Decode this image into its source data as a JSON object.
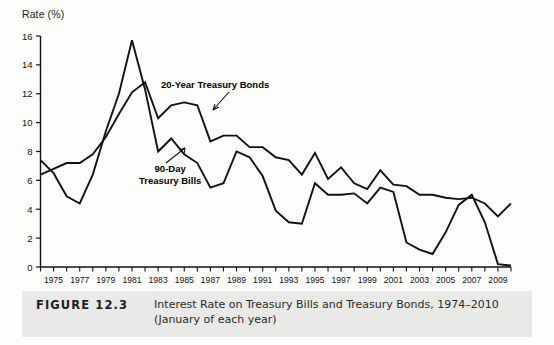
{
  "figure": {
    "number_label": "FIGURE 12.3",
    "caption_line1": "Interest Rate on Treasury Bills and Treasury Bonds, 1974–2010",
    "caption_line2": "(January of each year)"
  },
  "chart_data": {
    "type": "line",
    "title": "",
    "xlabel": "",
    "ylabel": "Rate (%)",
    "ylim": [
      0,
      16
    ],
    "xlim": [
      1974,
      2010
    ],
    "yticks": [
      0,
      2,
      4,
      6,
      8,
      10,
      12,
      14,
      16
    ],
    "ytick_labels": [
      "0",
      "2",
      "4",
      "6",
      "8",
      "10",
      "12",
      "14",
      "16"
    ],
    "xticks": [
      1974,
      1975,
      1976,
      1977,
      1978,
      1979,
      1980,
      1981,
      1982,
      1983,
      1984,
      1985,
      1986,
      1987,
      1988,
      1989,
      1990,
      1991,
      1992,
      1993,
      1994,
      1995,
      1996,
      1997,
      1998,
      1999,
      2000,
      2001,
      2002,
      2003,
      2004,
      2005,
      2006,
      2007,
      2008,
      2009,
      2010
    ],
    "xtick_labels": [
      "1975",
      "1977",
      "1979",
      "1981",
      "1983",
      "1985",
      "1987",
      "1989",
      "1991",
      "1993",
      "1995",
      "1997",
      "1999",
      "2001",
      "2003",
      "2005",
      "2007",
      "2009"
    ],
    "xtick_label_years": [
      1975,
      1977,
      1979,
      1981,
      1983,
      1985,
      1987,
      1989,
      1991,
      1993,
      1995,
      1997,
      1999,
      2001,
      2003,
      2005,
      2007,
      2009
    ],
    "grid": false,
    "legend_position": "inline-annotations",
    "line_color": "#111111",
    "series": [
      {
        "name": "20-Year Treasury Bonds",
        "annotation": "20-Year Treasury Bonds",
        "x": [
          1974,
          1975,
          1976,
          1977,
          1978,
          1979,
          1980,
          1981,
          1982,
          1983,
          1984,
          1985,
          1986,
          1987,
          1988,
          1989,
          1990,
          1991,
          1992,
          1993,
          1994,
          1995,
          1996,
          1997,
          1998,
          1999,
          2000,
          2001,
          2002,
          2003,
          2004,
          2005,
          2006,
          2007,
          2008,
          2009,
          2010
        ],
        "values": [
          6.4,
          6.8,
          7.2,
          7.2,
          7.8,
          9.0,
          10.6,
          12.1,
          12.8,
          10.3,
          11.2,
          11.4,
          11.2,
          8.7,
          9.1,
          9.1,
          8.3,
          8.3,
          7.6,
          7.4,
          6.4,
          7.9,
          6.1,
          6.9,
          5.8,
          5.4,
          6.7,
          5.7,
          5.6,
          5.0,
          5.0,
          4.8,
          4.7,
          4.8,
          4.4,
          3.5,
          4.4
        ]
      },
      {
        "name": "90-Day Treasury Bills",
        "annotation": "90-Day\nTreasury Bills",
        "x": [
          1974,
          1975,
          1976,
          1977,
          1978,
          1979,
          1980,
          1981,
          1982,
          1983,
          1984,
          1985,
          1986,
          1987,
          1988,
          1989,
          1990,
          1991,
          1992,
          1993,
          1994,
          1995,
          1996,
          1997,
          1998,
          1999,
          2000,
          2001,
          2002,
          2003,
          2004,
          2005,
          2006,
          2007,
          2008,
          2009,
          2010
        ],
        "values": [
          7.4,
          6.5,
          4.9,
          4.4,
          6.4,
          9.4,
          12.0,
          15.7,
          12.3,
          8.0,
          8.9,
          7.8,
          7.2,
          5.5,
          5.8,
          8.0,
          7.6,
          6.3,
          3.9,
          3.1,
          3.0,
          5.8,
          5.0,
          5.0,
          5.1,
          4.4,
          5.5,
          5.2,
          1.7,
          1.2,
          0.9,
          2.4,
          4.3,
          5.0,
          3.1,
          0.2,
          0.1
        ]
      }
    ]
  }
}
